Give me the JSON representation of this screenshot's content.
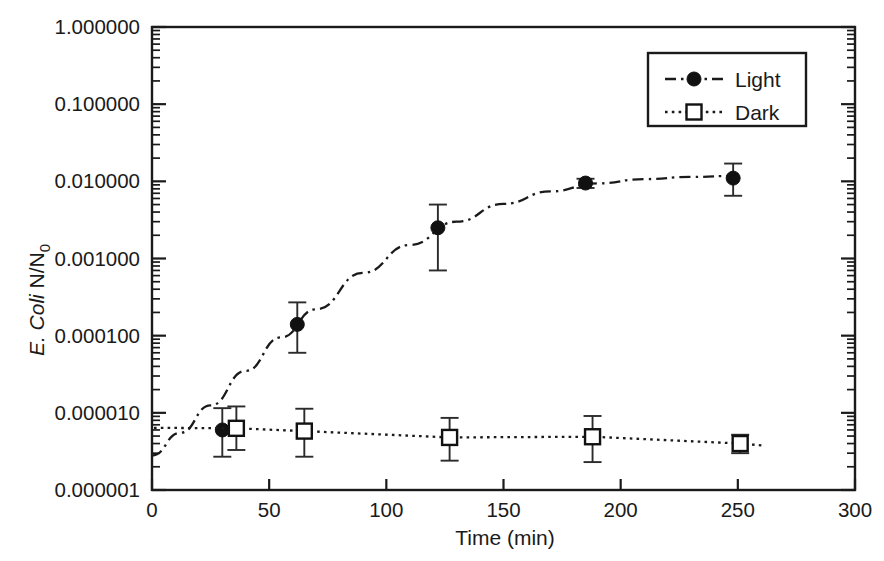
{
  "chart_data": {
    "type": "line",
    "title": "",
    "xlabel": "Time (min)",
    "ylabel": "E. Coli N/N0",
    "ylabel_parts": {
      "italic": "E. Coli",
      "upright": " N/N",
      "subscript": "0"
    },
    "xlim": [
      0,
      300
    ],
    "ylim": [
      1e-06,
      1.0
    ],
    "yscale": "log",
    "xscale": "linear",
    "grid": false,
    "legend_position": "top-right",
    "xticks": [
      0,
      50,
      100,
      150,
      200,
      250,
      300
    ],
    "xtick_labels": [
      "0",
      "50",
      "100",
      "150",
      "200",
      "250",
      "300"
    ],
    "yticks": [
      1.0,
      0.1,
      0.01,
      0.001,
      0.0001,
      1e-05,
      1e-06
    ],
    "ytick_labels": [
      "1.000000",
      "0.100000",
      "0.010000",
      "0.001000",
      "0.000100",
      "0.000010",
      "0.000001"
    ],
    "series": [
      {
        "name": "Light",
        "marker": "filled-circle",
        "linestyle": "dash-dot",
        "color": "#111111",
        "x": [
          30,
          62,
          122,
          185,
          248
        ],
        "y": [
          6e-06,
          0.00014,
          0.0025,
          0.0095,
          0.011
        ],
        "yerr_low": [
          3.3e-06,
          8e-05,
          0.0018,
          0.0013,
          0.0045
        ],
        "yerr_high": [
          5.5e-06,
          0.00013,
          0.0025,
          0.0013,
          0.006
        ],
        "fit_curve_x": [
          0,
          12,
          25,
          40,
          55,
          70,
          90,
          110,
          130,
          150,
          170,
          190,
          210,
          230,
          250
        ],
        "fit_curve_y": [
          2.8e-06,
          5.5e-06,
          1.25e-05,
          3.5e-05,
          9.5e-05,
          0.00022,
          0.00065,
          0.0015,
          0.003,
          0.0051,
          0.0074,
          0.0094,
          0.0107,
          0.0114,
          0.0118
        ]
      },
      {
        "name": "Dark",
        "marker": "open-square",
        "linestyle": "dotted",
        "color": "#111111",
        "x": [
          36,
          65,
          127,
          188,
          251
        ],
        "y": [
          6.3e-06,
          5.8e-06,
          4.8e-06,
          4.9e-06,
          4e-06
        ],
        "yerr_low": [
          3e-06,
          3.1e-06,
          2.4e-06,
          2.6e-06,
          1e-06
        ],
        "yerr_high": [
          5.8e-06,
          5.5e-06,
          3.8e-06,
          4.2e-06,
          1.2e-06
        ]
      }
    ]
  },
  "legend": {
    "entries": [
      {
        "label": "Light",
        "marker": "filled-circle",
        "linestyle": "dash-dot"
      },
      {
        "label": "Dark",
        "marker": "open-square",
        "linestyle": "dotted"
      }
    ]
  },
  "axes": {
    "x_title": "Time (min)",
    "y_title_italic": "E. Coli",
    "y_title_upright": " N/N",
    "y_title_subscript": "0"
  },
  "colors": {
    "ink": "#1a1a1a",
    "marker": "#111111",
    "background": "#ffffff"
  }
}
